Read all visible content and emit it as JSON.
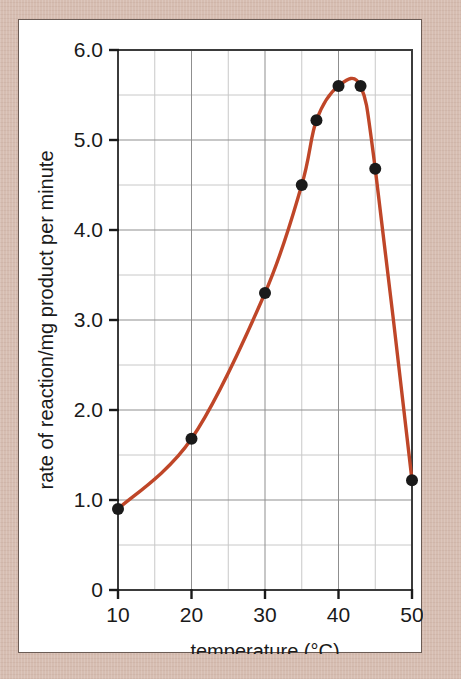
{
  "figure": {
    "mat_color": "#d6bdb1",
    "card_background": "#ffffff",
    "card_border_color": "#6b5c55"
  },
  "chart_data": {
    "type": "line",
    "title": "",
    "subtitle": "",
    "xlabel": "temperature (°C)",
    "ylabel": "rate of reaction/mg product per minute",
    "xlim": [
      10,
      50
    ],
    "ylim": [
      0,
      6.0
    ],
    "x_major_ticks": [
      10,
      20,
      30,
      40,
      50
    ],
    "x_major_tick_labels": [
      "10",
      "20",
      "30",
      "40",
      "50"
    ],
    "x_gridlines": [
      10,
      15,
      20,
      25,
      30,
      35,
      40,
      45,
      50
    ],
    "y_major_ticks": [
      0,
      1.0,
      2.0,
      3.0,
      4.0,
      5.0,
      6.0
    ],
    "y_major_tick_labels": [
      "0",
      "1.0",
      "2.0",
      "3.0",
      "4.0",
      "5.0",
      "6.0"
    ],
    "y_gridlines": [
      0,
      0.5,
      1.0,
      1.5,
      2.0,
      2.5,
      3.0,
      3.5,
      4.0,
      4.5,
      5.0,
      5.5,
      6.0
    ],
    "grid": true,
    "grid_color": "#8f8f8f",
    "minor_grid_color": "#c8c8c8",
    "legend": null,
    "line_color": "#bf4628",
    "marker_color": "#1a1a1a",
    "marker_shape": "circle",
    "x": [
      10,
      20,
      30,
      35,
      37,
      40,
      43,
      45,
      50
    ],
    "values": [
      0.9,
      1.68,
      3.3,
      4.5,
      5.22,
      5.6,
      5.6,
      4.68,
      1.22
    ],
    "points": [
      {
        "x": 10,
        "y": 0.9
      },
      {
        "x": 20,
        "y": 1.68
      },
      {
        "x": 30,
        "y": 3.3
      },
      {
        "x": 35,
        "y": 4.5
      },
      {
        "x": 37,
        "y": 5.22
      },
      {
        "x": 40,
        "y": 5.6
      },
      {
        "x": 43,
        "y": 5.6
      },
      {
        "x": 45,
        "y": 4.68
      },
      {
        "x": 50,
        "y": 1.22
      }
    ],
    "annotations": []
  }
}
